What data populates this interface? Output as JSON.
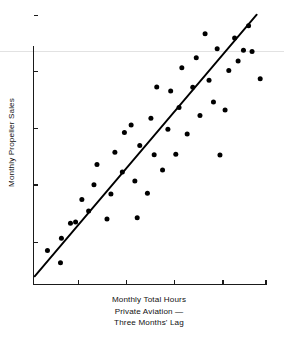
{
  "chart_data": {
    "type": "scatter",
    "title": "",
    "subtitle": "",
    "xlabel": "Monthly Total Hours Private Aviation — Three Months' Lag",
    "xlabel_lines": [
      "Monthly Total Hours",
      "Private Aviation —",
      "Three Months' Lag"
    ],
    "ylabel": "Monthly Propeller Sales",
    "grid": false,
    "legend_position": "none",
    "axis_tick_labels_shown": false,
    "xlim": [
      0,
      100
    ],
    "ylim": [
      0,
      100
    ],
    "x_tick_positions": [
      19.4,
      40.1,
      60.8,
      81.5,
      100.0
    ],
    "y_tick_positions": [
      15.5,
      36.5,
      57.1,
      78.1,
      98.7
    ],
    "point_color": "#000000",
    "line_color": "#000000",
    "axis_color": "#1a1a1a",
    "background_color": "#ffffff",
    "scan_artifact_color": "#e2e2e2",
    "series": [
      {
        "name": "Observations",
        "type": "scatter",
        "marker": "filled-circle",
        "marker_size_px": 5,
        "points": [
          [
            6.0,
            12.5
          ],
          [
            11.6,
            8.0
          ],
          [
            12.0,
            17.0
          ],
          [
            15.9,
            22.5
          ],
          [
            18.1,
            22.9
          ],
          [
            20.8,
            31.2
          ],
          [
            23.7,
            27.0
          ],
          [
            26.0,
            36.6
          ],
          [
            27.3,
            44.0
          ],
          [
            31.6,
            24.0
          ],
          [
            33.3,
            33.2
          ],
          [
            35.0,
            48.5
          ],
          [
            38.2,
            41.3
          ],
          [
            39.1,
            55.8
          ],
          [
            42.0,
            58.5
          ],
          [
            43.6,
            38.0
          ],
          [
            44.6,
            24.5
          ],
          [
            45.7,
            51.0
          ],
          [
            49.0,
            33.5
          ],
          [
            50.5,
            61.0
          ],
          [
            51.9,
            47.6
          ],
          [
            53.0,
            72.5
          ],
          [
            55.5,
            42.0
          ],
          [
            57.8,
            57.0
          ],
          [
            59.0,
            71.0
          ],
          [
            61.2,
            47.8
          ],
          [
            62.6,
            65.0
          ],
          [
            63.8,
            79.5
          ],
          [
            66.1,
            55.2
          ],
          [
            68.5,
            72.4
          ],
          [
            70.0,
            83.2
          ],
          [
            71.6,
            62.0
          ],
          [
            73.8,
            92.0
          ],
          [
            75.5,
            75.0
          ],
          [
            77.4,
            67.0
          ],
          [
            79.0,
            86.5
          ],
          [
            80.2,
            47.5
          ],
          [
            82.4,
            64.0
          ],
          [
            84.0,
            78.5
          ],
          [
            86.5,
            90.5
          ],
          [
            88.0,
            82.0
          ],
          [
            90.3,
            86.0
          ],
          [
            92.5,
            95.0
          ],
          [
            94.0,
            85.5
          ],
          [
            97.5,
            75.5
          ]
        ]
      },
      {
        "name": "Regression line",
        "type": "line",
        "x_from": 0.5,
        "y_from": 3.0,
        "x_to": 96.0,
        "y_to": 99.0
      }
    ],
    "annotations": []
  }
}
